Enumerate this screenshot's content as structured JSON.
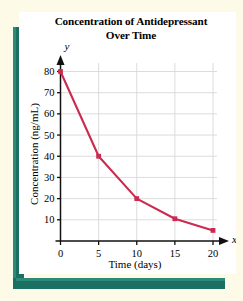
{
  "figure": {
    "background_color": "#fdfbe8",
    "card_color": "#ffffff",
    "frame_color": "#1a7062"
  },
  "title_lines": {
    "line1": "Concentration of Antidepressant",
    "line2": "Over Time"
  },
  "axis_symbols": {
    "x": "x",
    "y": "y"
  },
  "chart_data": {
    "type": "line",
    "title": "Concentration of Antidepressant Over Time",
    "xlabel": "Time (days)",
    "ylabel": "Concentration (ng/mL)",
    "xlim": [
      0,
      20
    ],
    "ylim": [
      0,
      85
    ],
    "xticks": [
      0,
      5,
      10,
      15,
      20
    ],
    "yticks": [
      10,
      20,
      30,
      40,
      50,
      60,
      70,
      80
    ],
    "xtick_labels": [
      "0",
      "5",
      "10",
      "15",
      "20"
    ],
    "ytick_labels": [
      "10",
      "20",
      "30",
      "40",
      "50",
      "60",
      "70",
      "80"
    ],
    "grid": true,
    "grid_color": "#d8d8d8",
    "legend": null,
    "series": [
      {
        "name": "Concentration",
        "color": "#cc2a50",
        "marker": "square",
        "x": [
          0,
          5,
          10,
          15,
          20
        ],
        "y": [
          80,
          40,
          20,
          10.5,
          5
        ],
        "points": [
          {
            "x": 0,
            "y": 80
          },
          {
            "x": 5,
            "y": 40
          },
          {
            "x": 10,
            "y": 20
          },
          {
            "x": 15,
            "y": 10.5
          },
          {
            "x": 20,
            "y": 5
          }
        ]
      }
    ]
  }
}
